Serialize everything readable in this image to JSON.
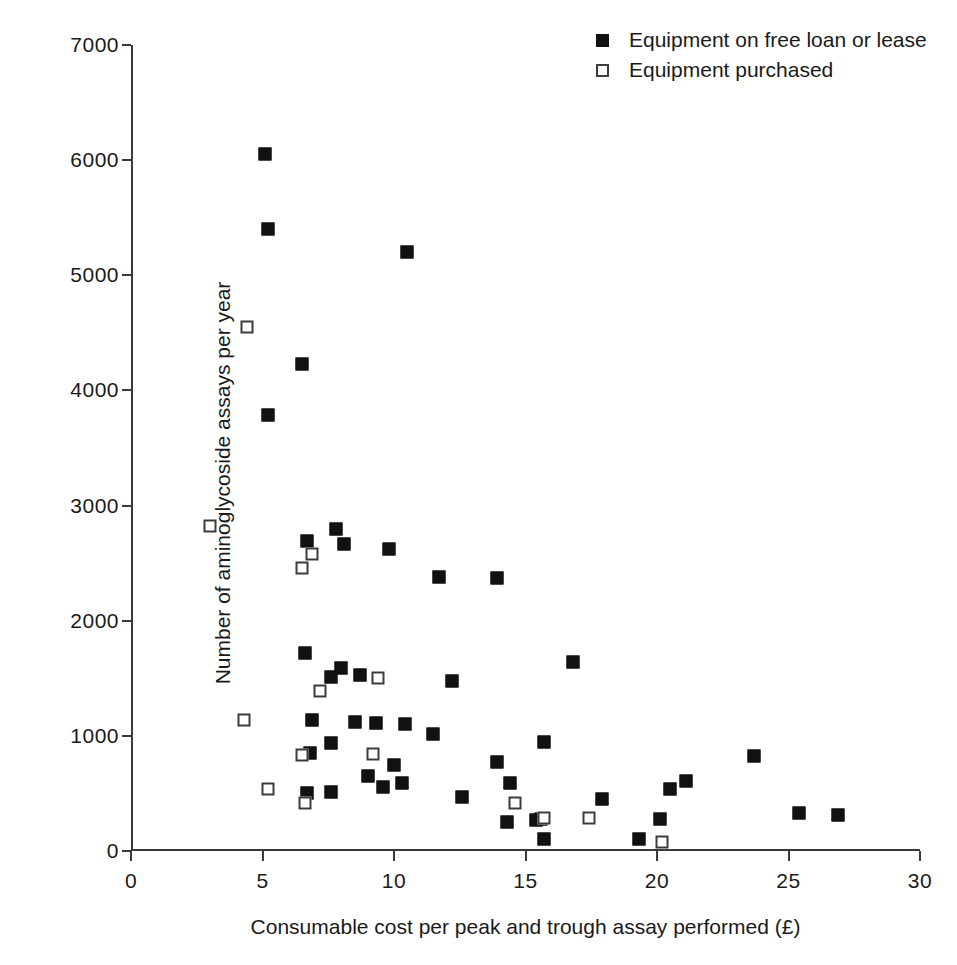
{
  "chart_data": {
    "type": "scatter",
    "title": "",
    "xlabel": "Consumable cost per peak and trough assay performed (£)",
    "ylabel": "Number of aminoglycoside assays per year",
    "xlim": [
      0,
      30
    ],
    "ylim": [
      0,
      7000
    ],
    "xticks": [
      0,
      5,
      10,
      15,
      20,
      25,
      30
    ],
    "yticks": [
      0,
      1000,
      2000,
      3000,
      4000,
      5000,
      6000,
      7000
    ],
    "xtick_labels": [
      "0",
      "5",
      "10",
      "15",
      "20",
      "25",
      "30"
    ],
    "ytick_labels": [
      "0",
      "1000",
      "2000",
      "3000",
      "4000",
      "5000",
      "6000",
      "7000"
    ],
    "grid": false,
    "legend_position": "top-right",
    "series": [
      {
        "name": "Equipment on free loan or lease",
        "marker": "filled-square",
        "color": "#111111",
        "points": [
          [
            5.1,
            6050
          ],
          [
            5.2,
            5400
          ],
          [
            10.5,
            5200
          ],
          [
            6.5,
            4230
          ],
          [
            5.2,
            3790
          ],
          [
            7.8,
            2800
          ],
          [
            6.7,
            2690
          ],
          [
            8.1,
            2670
          ],
          [
            9.8,
            2620
          ],
          [
            11.7,
            2380
          ],
          [
            13.9,
            2370
          ],
          [
            6.6,
            1720
          ],
          [
            16.8,
            1640
          ],
          [
            8.0,
            1590
          ],
          [
            7.6,
            1510
          ],
          [
            8.7,
            1530
          ],
          [
            12.2,
            1480
          ],
          [
            6.9,
            1140
          ],
          [
            8.5,
            1120
          ],
          [
            9.3,
            1110
          ],
          [
            10.4,
            1100
          ],
          [
            11.5,
            1020
          ],
          [
            7.6,
            935
          ],
          [
            15.7,
            950
          ],
          [
            6.8,
            855
          ],
          [
            10.0,
            750
          ],
          [
            13.9,
            775
          ],
          [
            9.0,
            655
          ],
          [
            10.3,
            590
          ],
          [
            9.6,
            555
          ],
          [
            21.1,
            605
          ],
          [
            14.4,
            590
          ],
          [
            23.7,
            825
          ],
          [
            6.7,
            505
          ],
          [
            7.6,
            510
          ],
          [
            12.6,
            470
          ],
          [
            17.9,
            455
          ],
          [
            20.5,
            540
          ],
          [
            14.3,
            255
          ],
          [
            15.4,
            270
          ],
          [
            15.6,
            280
          ],
          [
            20.1,
            275
          ],
          [
            25.4,
            330
          ],
          [
            26.9,
            310
          ],
          [
            19.3,
            105
          ],
          [
            15.7,
            105
          ]
        ]
      },
      {
        "name": "Equipment purchased",
        "marker": "open-square",
        "color": "#ffffff",
        "points": [
          [
            4.4,
            4550
          ],
          [
            3.0,
            2820
          ],
          [
            6.9,
            2580
          ],
          [
            6.5,
            2460
          ],
          [
            7.2,
            1390
          ],
          [
            9.4,
            1500
          ],
          [
            4.3,
            1140
          ],
          [
            6.5,
            835
          ],
          [
            9.2,
            845
          ],
          [
            5.2,
            540
          ],
          [
            6.6,
            415
          ],
          [
            14.6,
            420
          ],
          [
            15.7,
            285
          ],
          [
            17.4,
            285
          ],
          [
            20.2,
            80
          ]
        ]
      }
    ]
  },
  "legend": {
    "items": [
      {
        "label": "Equipment on free loan or lease",
        "marker": "filled"
      },
      {
        "label": "Equipment purchased",
        "marker": "open"
      }
    ]
  }
}
